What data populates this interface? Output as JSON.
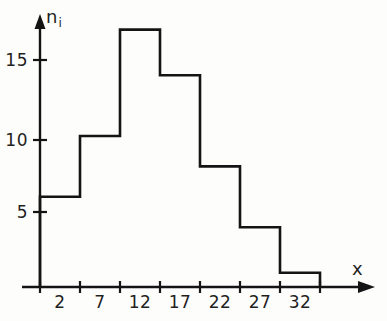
{
  "chart_data": {
    "type": "bar",
    "title": "",
    "subtitle": "",
    "xlabel": "x",
    "ylabel": "n_i",
    "ylabel_base": "n",
    "ylabel_sub": "i",
    "categories": [
      "2",
      "7",
      "12",
      "17",
      "22",
      "27",
      "32"
    ],
    "values": [
      6,
      10,
      17,
      14,
      8,
      4,
      1
    ],
    "bin_edges": [
      0,
      5,
      10,
      15,
      20,
      25,
      30,
      35
    ],
    "bin_width": 5,
    "y_ticks": [
      5,
      10,
      15
    ],
    "y_tick_labels": [
      "5",
      "10",
      "15"
    ],
    "ylim": [
      0,
      18
    ],
    "xlim": [
      0,
      37
    ],
    "grid": false,
    "legend": null,
    "annotations": [],
    "style": {
      "bar_fill": "#ffffff",
      "bar_stroke": "#141414",
      "axis_color": "#141414",
      "background": "#fdfdfc",
      "text_color": "#1f1f1f"
    }
  },
  "axes": {
    "y_axis_label": "n",
    "y_axis_subscript": "i",
    "x_axis_label": "x"
  }
}
